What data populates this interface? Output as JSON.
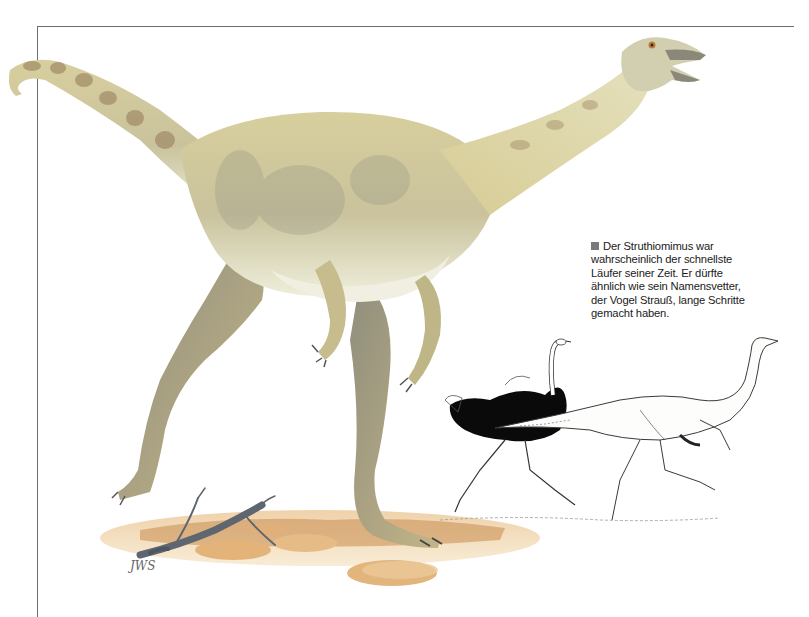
{
  "page": {
    "background": "#ffffff",
    "frame_color": "#6e6e6e"
  },
  "illustration": {
    "main_subject": "Struthiomimus painting",
    "signature": "JWS",
    "comparison_drawing": [
      "ostrich",
      "Struthiomimus"
    ],
    "colors": {
      "skin_light": "#e8e4c4",
      "skin_mid": "#cfc79a",
      "skin_shadow": "#9a9a86",
      "stripe": "#a08a66",
      "leg_shadow": "#7d7d72",
      "ground": "#d9a56a",
      "ground_dark": "#b97a3e",
      "rock": "#e2b57c",
      "branch": "#5f6670",
      "ostrich_plumage": "#0a0a0a",
      "line_art": "#3a3a3a"
    }
  },
  "caption": {
    "bullet_color": "#7a7a7a",
    "lines": [
      "Der Struthiomimus war",
      "wahrscheinlich der schnellste",
      "Läufer seiner Zeit. Er dürfte",
      "ähnlich wie sein Namensvetter,",
      "der Vogel Strauß, lange Schritte",
      "gemacht haben."
    ]
  }
}
